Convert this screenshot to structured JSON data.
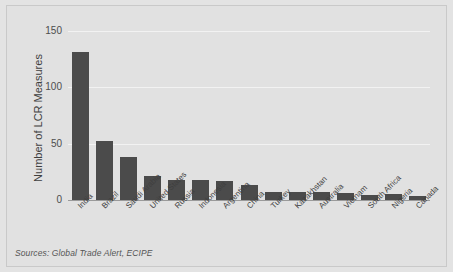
{
  "chart_data": {
    "type": "bar",
    "title": "",
    "xlabel": "",
    "ylabel": "Number of LCR Measures",
    "ylim": [
      0,
      150
    ],
    "yticks": [
      0,
      50,
      100,
      150
    ],
    "grid": true,
    "legend": null,
    "categories": [
      "India",
      "Brazil",
      "Saudi Arabia",
      "United States",
      "Russia",
      "Indonesia",
      "Argentina",
      "China",
      "Turkey",
      "Kazakhstan",
      "Australia",
      "Vietnam",
      "South Africa",
      "Nigeria",
      "Canada"
    ],
    "values": [
      125,
      50,
      36,
      20,
      17,
      17,
      16,
      13,
      7,
      7,
      7,
      6,
      4,
      5,
      3
    ],
    "bar_color": "#4b4b4b",
    "background_color": "#e1e1e1",
    "gridline_color": "#f2f2f2"
  },
  "axis": {
    "ytick_labels": [
      "150",
      "100",
      "50",
      "0"
    ],
    "ytick_values": [
      150,
      100,
      50,
      0
    ]
  },
  "notes": {
    "sources": "Sources: Global Trade Alert, ECIPE"
  }
}
